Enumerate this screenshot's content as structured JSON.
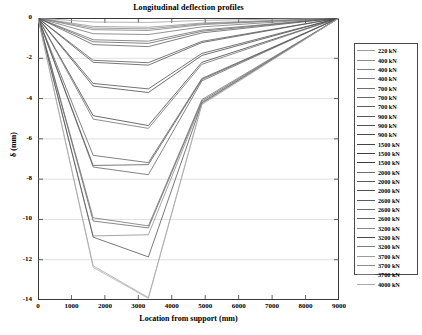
{
  "chart_data": {
    "type": "line",
    "title": "Longitudinal deflection profiles",
    "xlabel": "Location from support (mm)",
    "ylabel": "δ (mm)",
    "xlim": [
      0,
      9000
    ],
    "ylim": [
      -14,
      0
    ],
    "xticks": [
      0,
      1000,
      2000,
      3000,
      4000,
      5000,
      6000,
      7000,
      8000,
      9000
    ],
    "xtick_labels": [
      "0",
      "1000",
      "2000",
      "3000",
      "4000",
      "5000",
      "6000",
      "7000",
      "8000",
      "9000"
    ],
    "yticks": [
      0,
      -2,
      -4,
      -6,
      -8,
      -10,
      -12,
      -14
    ],
    "ytick_labels": [
      "0",
      "-2",
      "-4",
      "-6",
      "-8",
      "-10",
      "-12",
      "-14"
    ],
    "grid": "horizontal",
    "legend_position": "right-outside",
    "x": [
      0,
      1650,
      3300,
      4900,
      9000
    ],
    "series": [
      {
        "name": "220 kN",
        "values": [
          0,
          -0.2,
          -0.22,
          -0.12,
          0
        ],
        "color": "#9a9a9a"
      },
      {
        "name": "400 kN",
        "values": [
          0,
          -0.42,
          -0.46,
          -0.25,
          0
        ],
        "color": "#8c8c8c"
      },
      {
        "name": "400 kN",
        "values": [
          0,
          -0.5,
          -0.54,
          -0.29,
          0
        ],
        "color": "#828282"
      },
      {
        "name": "400 kN",
        "values": [
          0,
          -0.58,
          -0.62,
          -0.33,
          0
        ],
        "color": "#7a7a7a"
      },
      {
        "name": "700 kN",
        "values": [
          0,
          -0.78,
          -0.82,
          -0.44,
          0
        ],
        "color": "#6f6f6f"
      },
      {
        "name": "700 kN",
        "values": [
          0,
          -1.08,
          -1.15,
          -0.6,
          0
        ],
        "color": "#666666"
      },
      {
        "name": "700 kN",
        "values": [
          0,
          -1.18,
          -1.26,
          -0.66,
          0
        ],
        "color": "#5e5e5e"
      },
      {
        "name": "900 kN",
        "values": [
          0,
          -1.32,
          -1.42,
          -0.74,
          0
        ],
        "color": "#575757"
      },
      {
        "name": "900 kN",
        "values": [
          0,
          -2.1,
          -2.22,
          -1.16,
          0
        ],
        "color": "#505050"
      },
      {
        "name": "900 kN",
        "values": [
          0,
          -2.2,
          -2.34,
          -1.22,
          0
        ],
        "color": "#4a4a4a"
      },
      {
        "name": "1500 kN",
        "values": [
          0,
          -3.25,
          -3.52,
          -1.76,
          0
        ],
        "color": "#454545"
      },
      {
        "name": "1500 kN",
        "values": [
          0,
          -3.38,
          -3.7,
          -1.86,
          0
        ],
        "color": "#404040"
      },
      {
        "name": "1500 kN",
        "values": [
          0,
          -4.85,
          -5.34,
          -2.2,
          0
        ],
        "color": "#3b3b3b"
      },
      {
        "name": "2000 kN",
        "values": [
          0,
          -5.02,
          -5.48,
          -2.3,
          0
        ],
        "color": "#6b6b6b"
      },
      {
        "name": "2000 kN",
        "values": [
          0,
          -6.82,
          -7.18,
          -3.0,
          0
        ],
        "color": "#5a5a5a"
      },
      {
        "name": "2000 kN",
        "values": [
          0,
          -7.32,
          -7.28,
          -3.05,
          0
        ],
        "color": "#4e4e4e"
      },
      {
        "name": "2600 kN",
        "values": [
          0,
          -7.4,
          -7.78,
          -3.12,
          0
        ],
        "color": "#5c5c5c"
      },
      {
        "name": "2600 kN",
        "values": [
          0,
          -9.92,
          -10.32,
          -4.05,
          0
        ],
        "color": "#6e6e6e"
      },
      {
        "name": "2600 kN",
        "values": [
          0,
          -10.08,
          -10.42,
          -4.12,
          0
        ],
        "color": "#606060"
      },
      {
        "name": "3200 kN",
        "values": [
          0,
          -10.82,
          -10.76,
          -4.18,
          0
        ],
        "color": "#878787"
      },
      {
        "name": "3200 kN",
        "values": [
          0,
          -10.88,
          -11.86,
          -4.22,
          0
        ],
        "color": "#4c4c4c"
      },
      {
        "name": "3700 kN",
        "values": [
          0,
          -12.3,
          -13.88,
          -4.26,
          0
        ],
        "color": "#9e9e9e"
      },
      {
        "name": "4000 kN",
        "values": [
          0,
          -12.38,
          -13.92,
          -4.3,
          0
        ],
        "color": "#ababab"
      }
    ],
    "legend_entries": [
      "220 kN",
      "400 kN",
      "400 kN",
      "400 kN",
      "700 kN",
      "700 kN",
      "700 kN",
      "900 kN",
      "900 kN",
      "900 kN",
      "1500 kN",
      "1500 kN",
      "1500 kN",
      "2000 kN",
      "2000 kN",
      "2000 kN",
      "2600 kN",
      "2600 kN",
      "2600 kN",
      "3200 kN",
      "3200 kN",
      "3200 kN",
      "3700 kN",
      "3700 kN",
      "3700 kN",
      "4000 kN"
    ],
    "legend_colors": [
      "#9a9a9a",
      "#8c8c8c",
      "#828282",
      "#7a7a7a",
      "#6f6f6f",
      "#666666",
      "#5e5e5e",
      "#575757",
      "#505050",
      "#4a4a4a",
      "#454545",
      "#404040",
      "#3b3b3b",
      "#6b6b6b",
      "#5a5a5a",
      "#4e4e4e",
      "#5c5c5c",
      "#6e6e6e",
      "#606060",
      "#878787",
      "#4c4c4c",
      "#7d7d7d",
      "#9e9e9e",
      "#8a8a8a",
      "#747474",
      "#ababab"
    ],
    "axis_color": "#3a3a3a",
    "grid_color": "#c9c9c9",
    "background": "#ffffff"
  }
}
